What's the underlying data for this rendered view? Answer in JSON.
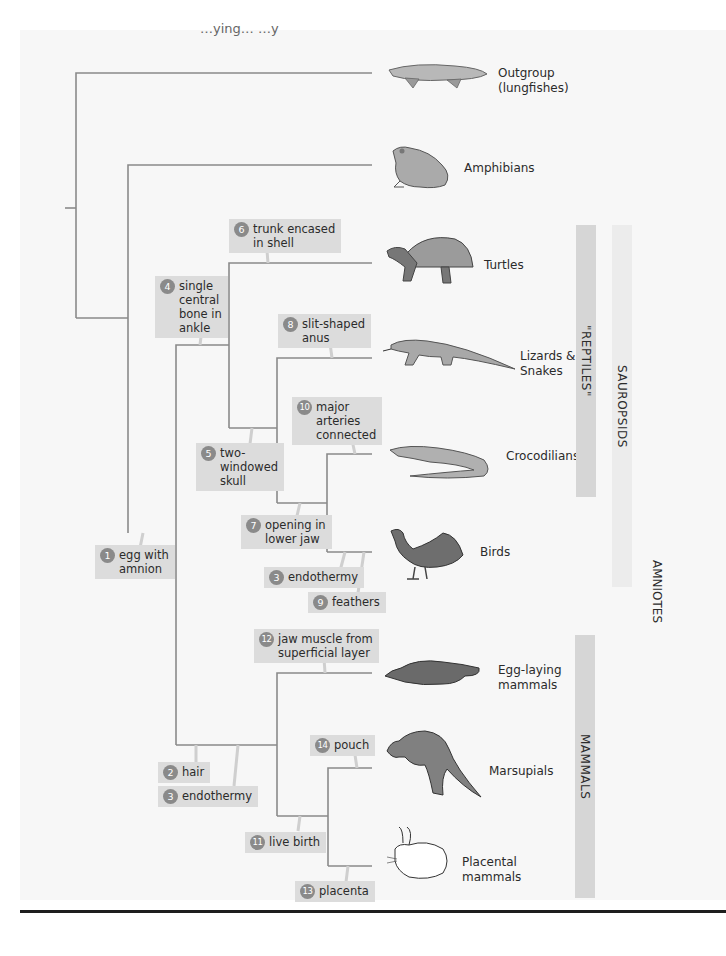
{
  "figure": {
    "cut_off_header": "…ying… …y"
  },
  "taxa": [
    {
      "id": "lungfishes",
      "label_line1": "Outgroup",
      "label_line2": "(lungfishes)"
    },
    {
      "id": "amphibians",
      "label_line1": "Amphibians",
      "label_line2": ""
    },
    {
      "id": "turtles",
      "label_line1": "Turtles",
      "label_line2": ""
    },
    {
      "id": "lizards",
      "label_line1": "Lizards &",
      "label_line2": "Snakes"
    },
    {
      "id": "crocodilians",
      "label_line1": "Crocodilians",
      "label_line2": ""
    },
    {
      "id": "birds",
      "label_line1": "Birds",
      "label_line2": ""
    },
    {
      "id": "egg-laying",
      "label_line1": "Egg-laying",
      "label_line2": "mammals"
    },
    {
      "id": "marsupials",
      "label_line1": "Marsupials",
      "label_line2": ""
    },
    {
      "id": "placental",
      "label_line1": "Placental",
      "label_line2": "mammals"
    }
  ],
  "traits": [
    {
      "num": "1",
      "text": "egg with amnion"
    },
    {
      "num": "2",
      "text": "hair"
    },
    {
      "num": "3",
      "text": "endothermy"
    },
    {
      "num": "4",
      "text": "single central bone in ankle"
    },
    {
      "num": "5",
      "text": "two-windowed skull"
    },
    {
      "num": "6",
      "text": "trunk encased in shell"
    },
    {
      "num": "7",
      "text": "opening in lower jaw"
    },
    {
      "num": "8",
      "text": "slit-shaped anus"
    },
    {
      "num": "3",
      "text": "endothermy"
    },
    {
      "num": "9",
      "text": "feathers"
    },
    {
      "num": "10",
      "text": "major arteries connected"
    },
    {
      "num": "11",
      "text": "live birth"
    },
    {
      "num": "12",
      "text": "jaw muscle from superficial layer"
    },
    {
      "num": "13",
      "text": "placenta"
    },
    {
      "num": "14",
      "text": "pouch"
    }
  ],
  "trait_lines": {
    "t1": [
      "egg with",
      "amnion"
    ],
    "t2": [
      "hair"
    ],
    "t3a": [
      "endothermy"
    ],
    "t4": [
      "single",
      "central",
      "bone in",
      "ankle"
    ],
    "t5": [
      "two-",
      "windowed",
      "skull"
    ],
    "t6": [
      "trunk encased",
      "in shell"
    ],
    "t7": [
      "opening in",
      "lower jaw"
    ],
    "t8": [
      "slit-shaped",
      "anus"
    ],
    "t3b": [
      "endothermy"
    ],
    "t9": [
      "feathers"
    ],
    "t10": [
      "major",
      "arteries",
      "connected"
    ],
    "t11": [
      "live birth"
    ],
    "t12": [
      "jaw muscle from",
      "superficial layer"
    ],
    "t13": [
      "placenta"
    ],
    "t14": [
      "pouch"
    ]
  },
  "groups": {
    "reptiles": "\"REPTILES\"",
    "sauropsids": "SAUROPSIDS",
    "amniotes": "AMNIOTES",
    "mammals": "MAMMALS"
  },
  "colors": {
    "trait_box": "#dcdcdc",
    "badge": "#8a8a8a",
    "tree_line": "#8a8a8a",
    "reptiles_bar": "#d6d6d6",
    "sauropsids_bar": "#ececec",
    "mammals_bar": "#d6d6d6"
  }
}
